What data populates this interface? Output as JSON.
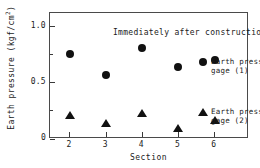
{
  "chart_data": {
    "type": "scatter",
    "title": "Immediately after construction",
    "xlabel": "Section",
    "ylabel": "Earth pressure  (kgf/cm",
    "ylabel_sup": "2",
    "ylabel_tail": ")",
    "categories": [
      2,
      3,
      4,
      5,
      6
    ],
    "x": [
      2,
      3,
      4,
      5,
      6
    ],
    "xlim": [
      1.45,
      6.95
    ],
    "ylim": [
      0,
      1.12
    ],
    "grid": false,
    "legend_position": "right-inside",
    "xticks": [
      "2",
      "3",
      "4",
      "5",
      "6"
    ],
    "yticks": [
      {
        "value": 0,
        "label": "0",
        "major": true
      },
      {
        "value": 0.25,
        "label": "",
        "major": false
      },
      {
        "value": 0.5,
        "label": "0.5",
        "major": true
      },
      {
        "value": 0.75,
        "label": "",
        "major": false
      },
      {
        "value": 1.0,
        "label": "1.0",
        "major": true
      }
    ],
    "series": [
      {
        "name": "Earth pressure gage (1)",
        "legend_line1": "Earth pressure",
        "legend_line2": "gage (1)",
        "marker": "circle",
        "color": "#111111",
        "values": [
          0.76,
          0.57,
          0.81,
          0.64,
          0.7
        ]
      },
      {
        "name": "Earth pressure gage (2)",
        "legend_line1": "Earth pressure",
        "legend_line2": "gage (2)",
        "marker": "triangle",
        "color": "#111111",
        "values": [
          0.21,
          0.14,
          0.23,
          0.1,
          0.17
        ]
      }
    ]
  }
}
